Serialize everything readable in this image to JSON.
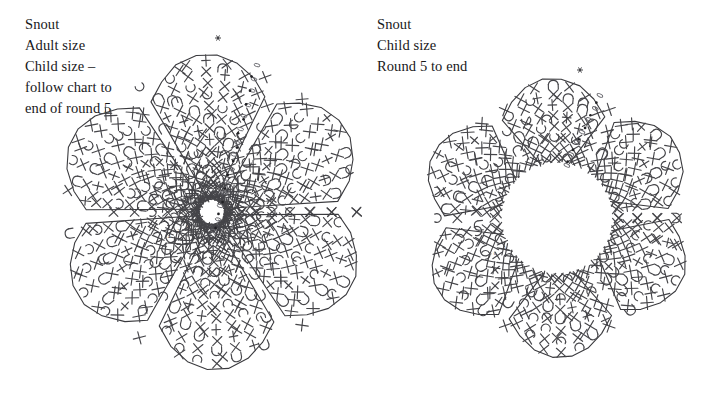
{
  "document": {
    "title": "Snout crochet charts",
    "background_color": "#ffffff",
    "ink_color": "#454549",
    "outline_color": "#3a3a3e"
  },
  "captions": {
    "left": {
      "name": "snout-adult-caption",
      "lines": [
        "Snout",
        "Adult size",
        "Child size –",
        "follow chart to",
        "end of round 5"
      ]
    },
    "right": {
      "name": "snout-child-caption",
      "lines": [
        "Snout",
        "Child size",
        "Round 5 to end"
      ]
    }
  },
  "symbol_legend": [
    {
      "id": "cross",
      "label": "single crochet",
      "glyph": "X"
    },
    {
      "id": "treble",
      "label": "treble crochet",
      "glyph": "vertical bar with cross bars"
    },
    {
      "id": "cluster-u",
      "label": "cluster / decrease",
      "glyph": "U"
    },
    {
      "id": "cluster-c",
      "label": "half cluster",
      "glyph": "C"
    },
    {
      "id": "chain",
      "label": "chain",
      "glyph": "oval"
    },
    {
      "id": "slip",
      "label": "slip stitch",
      "glyph": "filled dot"
    },
    {
      "id": "start",
      "label": "round start",
      "glyph": "asterisk"
    }
  ],
  "chart_data": {
    "type": "diagram",
    "diagram_kind": "crochet-round-chart",
    "charts": [
      {
        "id": "adult-snout",
        "name": "chart-adult-snout",
        "title": "Snout Adult size",
        "center": [
          212,
          212
        ],
        "rounds_shown": [
          1,
          2,
          3,
          4,
          5,
          6,
          7,
          8
        ],
        "round_labels": [
          "1",
          "2",
          "3",
          "4"
        ],
        "hollow_center": false,
        "petals": 6,
        "petal_rotation_deg": -92,
        "petal_radius": 158,
        "petal_width_deg": 54,
        "ring_radii": [
          18,
          30,
          44,
          60,
          78,
          98,
          120,
          145
        ],
        "ray_count": 42,
        "start_marker": [
          218,
          38
        ],
        "chain_trail": {
          "from": [
            258,
            66
          ],
          "to": [
            214,
            232
          ],
          "count": 14
        },
        "dot_trail": {
          "from": [
            252,
            78
          ],
          "to": [
            216,
            228
          ],
          "count": 12
        }
      },
      {
        "id": "child-snout",
        "name": "chart-child-snout",
        "title": "Snout Child size",
        "center": [
          557,
          218
        ],
        "rounds_shown": [
          5,
          6,
          7,
          8
        ],
        "round_labels": [
          "5",
          "6"
        ],
        "hollow_center": true,
        "inner_radius": 56,
        "petals": 6,
        "petal_rotation_deg": -92,
        "petal_radius": 140,
        "petal_width_deg": 54,
        "ring_radii": [
          62,
          80,
          100,
          120
        ],
        "ray_count": 36,
        "start_marker": [
          580,
          70
        ],
        "chain_trail": {
          "from": [
            600,
            96
          ],
          "to": [
            566,
            166
          ],
          "count": 7
        },
        "dot_trail": {
          "from": [
            596,
            104
          ],
          "to": [
            568,
            162
          ],
          "count": 6
        }
      }
    ]
  }
}
